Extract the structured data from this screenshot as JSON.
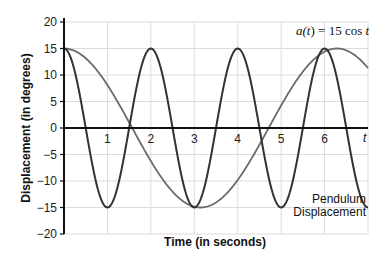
{
  "chart_data": {
    "type": "line",
    "title": "",
    "xlabel": "Time (in seconds)",
    "ylabel": "Displacement (in degrees)",
    "x_axis_symbol": "t",
    "xlim": [
      0,
      7
    ],
    "ylim": [
      -20,
      20
    ],
    "x_ticks": [
      1,
      2,
      3,
      4,
      5,
      6
    ],
    "y_ticks": [
      20,
      15,
      10,
      5,
      0,
      -5,
      -10,
      -15,
      -20
    ],
    "grid": true,
    "series": [
      {
        "name": "a(t) = 15 cos t",
        "function": "15*cos(t)",
        "color": "#6b6b6b",
        "x": [
          0,
          0.5,
          1,
          1.5,
          2,
          2.5,
          3,
          3.14,
          3.5,
          4,
          4.5,
          5,
          5.5,
          6,
          6.28,
          6.5,
          7
        ],
        "values": [
          15,
          13.2,
          8.1,
          1.1,
          -6.2,
          -12.0,
          -14.8,
          -15,
          -14.0,
          -9.8,
          -3.2,
          4.3,
          10.6,
          14.4,
          15,
          14.6,
          11.3
        ]
      },
      {
        "name": "Pendulum Displacement",
        "function": "15*cos(pi*t)",
        "color": "#333333",
        "x": [
          0,
          0.5,
          1,
          1.5,
          2,
          2.5,
          3,
          3.5,
          4,
          4.5,
          5,
          5.5,
          6,
          6.5,
          7
        ],
        "values": [
          15,
          0,
          -15,
          0,
          15,
          0,
          -15,
          0,
          15,
          0,
          -15,
          0,
          15,
          0,
          -15
        ]
      }
    ],
    "annotations": [
      {
        "text": "a(t) = 15 cos t",
        "x": 6.0,
        "y": 17.5
      },
      {
        "text": "Pendulum",
        "x": 6.3,
        "y": -13.5
      },
      {
        "text": "Displacement",
        "x": 6.3,
        "y": -16.5
      }
    ]
  },
  "labels": {
    "eq_a": "a(",
    "eq_t": "t",
    "eq_rest": ") = 15 cos ",
    "eq_t2": "t",
    "pendulum_line1": "Pendulum",
    "pendulum_line2": "Displacement"
  }
}
